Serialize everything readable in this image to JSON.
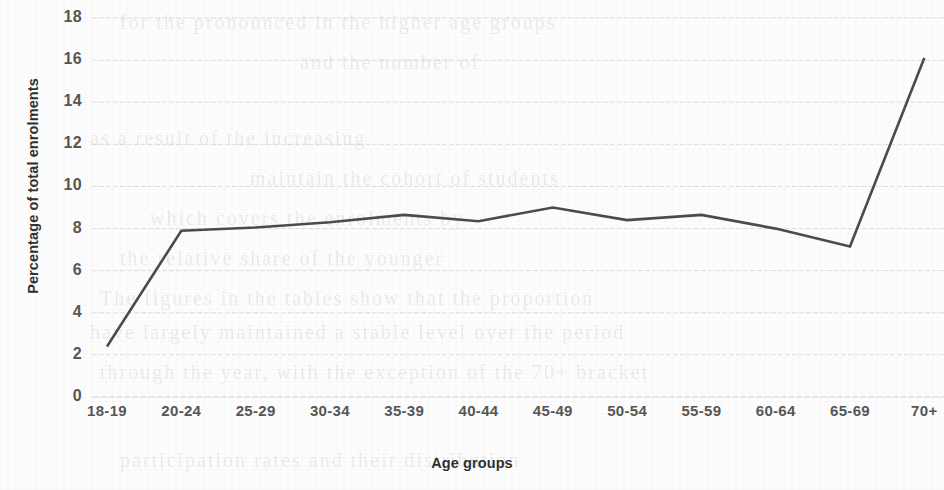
{
  "chart_data": {
    "type": "line",
    "title": "",
    "subtitle": "",
    "xlabel": "Age groups",
    "ylabel": "Percentage of total enrolments",
    "categories": [
      "18-19",
      "20-24",
      "25-29",
      "30-34",
      "35-39",
      "40-44",
      "45-49",
      "50-54",
      "55-59",
      "60-64",
      "65-69",
      "70+"
    ],
    "values": [
      2.4,
      7.9,
      8.05,
      8.3,
      8.65,
      8.35,
      9.0,
      8.4,
      8.65,
      8.0,
      7.15,
      16.1
    ],
    "series": [
      {
        "name": "Percentage of total enrolments",
        "values": [
          2.4,
          7.9,
          8.05,
          8.3,
          8.65,
          8.35,
          9.0,
          8.4,
          8.65,
          8.0,
          7.15,
          16.1
        ]
      }
    ],
    "ylim": [
      0,
      18
    ],
    "xlim_categories": 12,
    "ytick_labels": [
      "18",
      "16",
      "14",
      "12",
      "10",
      "8",
      "6",
      "4",
      "2",
      "0"
    ],
    "ytick_values": [
      18,
      16,
      14,
      12,
      10,
      8,
      6,
      4,
      2,
      0
    ],
    "grid": true,
    "grid_axis": "y",
    "grid_style": "dotted",
    "legend": false,
    "legend_position": "none",
    "line_color": "#4a4a4a",
    "grid_color": "#c9c9cf",
    "text_color": "#555555",
    "background_color": "#fdfdfd"
  },
  "ghost_text": {
    "lines": [
      {
        "x": 120,
        "y": 2,
        "text": "for the pronounced in the higher age groups"
      },
      {
        "x": 300,
        "y": 42,
        "text": "and the number of"
      },
      {
        "x": 90,
        "y": 118,
        "text": "as a result of the increasing"
      },
      {
        "x": 250,
        "y": 158,
        "text": "maintain the cohort of students"
      },
      {
        "x": 150,
        "y": 198,
        "text": "which covers the enrolments by"
      },
      {
        "x": 120,
        "y": 238,
        "text": "the relative share of the younger"
      },
      {
        "x": 100,
        "y": 278,
        "text": "The figures in the tables show that the proportion"
      },
      {
        "x": 90,
        "y": 312,
        "text": "have largely maintained a stable level over the period"
      },
      {
        "x": 100,
        "y": 352,
        "text": "through the year, with the exception of the 70+ bracket"
      },
      {
        "x": 120,
        "y": 440,
        "text": "participation rates and their distribution"
      }
    ]
  }
}
